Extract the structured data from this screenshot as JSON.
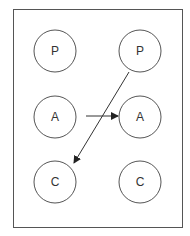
{
  "diagram": {
    "frame": {
      "x": 13,
      "y": 9,
      "width": 169,
      "height": 218,
      "stroke": "#555555"
    },
    "node_style": {
      "radius": 21,
      "stroke": "#555555",
      "fill": "#ffffff"
    },
    "nodes": [
      {
        "id": "p-left",
        "label": "P",
        "cx": 55,
        "cy": 51
      },
      {
        "id": "p-right",
        "label": "P",
        "cx": 140,
        "cy": 51
      },
      {
        "id": "a-left",
        "label": "A",
        "cx": 55,
        "cy": 117
      },
      {
        "id": "a-right",
        "label": "A",
        "cx": 140,
        "cy": 117
      },
      {
        "id": "c-left",
        "label": "C",
        "cx": 55,
        "cy": 182
      },
      {
        "id": "c-right",
        "label": "C",
        "cx": 140,
        "cy": 182
      }
    ],
    "edges": [
      {
        "from": "a-left",
        "to": "a-right",
        "x1": 86,
        "y1": 116,
        "x2": 118,
        "y2": 116
      },
      {
        "from": "p-right",
        "to": "c-left",
        "x1": 129,
        "y1": 72,
        "x2": 74,
        "y2": 163
      }
    ],
    "edge_color": "#333333"
  }
}
